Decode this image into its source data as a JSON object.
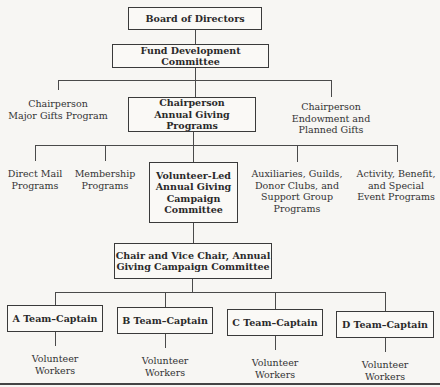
{
  "diagram": {
    "type": "org-chart",
    "level1": {
      "label": "Board of Directors"
    },
    "level2": {
      "label": "Fund Development Committee"
    },
    "level3": {
      "left": {
        "label": "Chairperson\nMajor Gifts Program"
      },
      "center": {
        "label": "Chairperson\nAnnual Giving Programs"
      },
      "right": {
        "label": "Chairperson\nEndowment and\nPlanned Gifts"
      }
    },
    "level4": {
      "items": [
        {
          "label": "Direct Mail\nPrograms"
        },
        {
          "label": "Membership\nPrograms"
        },
        {
          "label": "Volunteer-Led\nAnnual Giving\nCampaign\nCommittee"
        },
        {
          "label": "Auxiliaries, Guilds,\nDonor Clubs, and\nSupport Group\nPrograms"
        },
        {
          "label": "Activity, Benefit,\nand Special\nEvent Programs"
        }
      ]
    },
    "level5": {
      "label": "Chair and Vice Chair, Annual\nGiving Campaign Committee"
    },
    "teams": [
      {
        "captain": "A Team–Captain",
        "workers": "Volunteer\nWorkers"
      },
      {
        "captain": "B Team–Captain",
        "workers": "Volunteer\nWorkers"
      },
      {
        "captain": "C Team–Captain",
        "workers": "Volunteer\nWorkers"
      },
      {
        "captain": "D Team–Captain",
        "workers": "Volunteer\nWorkers"
      }
    ]
  }
}
